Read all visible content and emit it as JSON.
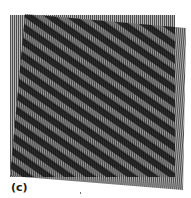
{
  "figure": {
    "panel_label": "(c)",
    "grating_fixed": {
      "x": 10,
      "y": 15,
      "width": 165,
      "height": 162,
      "line_period_px": 2,
      "rotation_deg": 0
    },
    "grating_rotated": {
      "corners": [
        [
          25,
          14
        ],
        [
          186,
          28
        ],
        [
          183,
          190
        ],
        [
          10,
          176
        ]
      ],
      "line_period_px": 2,
      "rotation_deg": 5
    },
    "moire_band_period_px": 12,
    "moire_band_angle_deg": 35,
    "colors": {
      "dark_band": "#1a1a1a",
      "light_band": "#8a8a8a",
      "line_light": "#b5b5b5",
      "line_dark": "#555555",
      "background": "#ffffff"
    }
  }
}
